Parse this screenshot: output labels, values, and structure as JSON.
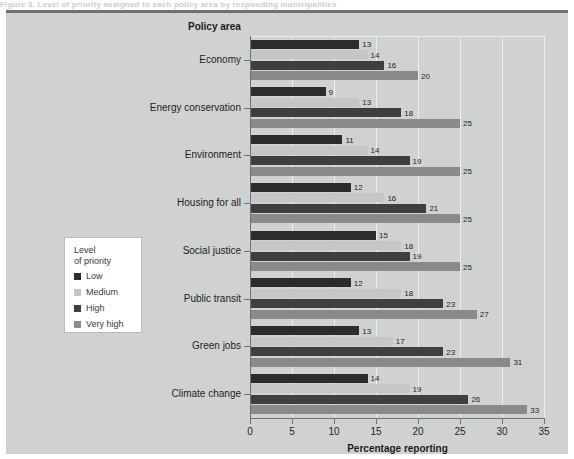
{
  "top_clip_text": "Figure 3.  Level of priority assigned to each policy area by responding municipalities",
  "panel": {
    "category_axis_title": "Policy area"
  },
  "legend": {
    "title": "Level\nof priority",
    "items": [
      {
        "label": "Low",
        "color": "#2c2c2c"
      },
      {
        "label": "Medium",
        "color": "#c6c6c6"
      },
      {
        "label": "High",
        "color": "#3f3f3f"
      },
      {
        "label": "Very high",
        "color": "#8a8a8a"
      }
    ]
  },
  "chart_data": {
    "type": "bar",
    "orientation": "horizontal",
    "title": "",
    "xlabel": "Percentage reporting",
    "ylabel": "Policy area",
    "xlim": [
      0,
      35
    ],
    "xticks": [
      0,
      5,
      10,
      15,
      20,
      25,
      30,
      35
    ],
    "grid": "vertical",
    "legend_position": "left-inside",
    "categories": [
      "Economy",
      "Energy conservation",
      "Environment",
      "Housing for all",
      "Social justice",
      "Public transit",
      "Green jobs",
      "Climate change"
    ],
    "series": [
      {
        "name": "Low",
        "color": "#2c2c2c",
        "values": [
          13,
          9,
          11,
          12,
          15,
          12,
          13,
          14
        ]
      },
      {
        "name": "Medium",
        "color": "#c6c6c6",
        "values": [
          14,
          13,
          14,
          16,
          18,
          18,
          17,
          19
        ]
      },
      {
        "name": "High",
        "color": "#3f3f3f",
        "values": [
          16,
          18,
          19,
          21,
          19,
          23,
          23,
          26
        ]
      },
      {
        "name": "Very high",
        "color": "#8a8a8a",
        "values": [
          20,
          25,
          25,
          25,
          25,
          27,
          31,
          33
        ]
      }
    ]
  }
}
